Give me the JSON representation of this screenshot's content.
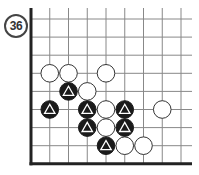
{
  "problem": {
    "number": "36"
  },
  "board": {
    "origin_x": 31,
    "origin_y": 19,
    "spacing_x": 18.75,
    "spacing_y": 18.1,
    "cols": 9,
    "rows": 9,
    "right_extent": 192,
    "bottom_edge_row": 8,
    "top_extends": true,
    "right_extends": true,
    "left_edge": true,
    "bottom_edge": true,
    "line_color": "#888888",
    "edge_color": "#222222",
    "black_color": "#1a1a1a",
    "white_color": "#ffffff",
    "marker": "triangle",
    "stones": [
      {
        "color": "white",
        "col": 1,
        "row": 3,
        "marked": false
      },
      {
        "color": "white",
        "col": 2,
        "row": 3,
        "marked": false
      },
      {
        "color": "white",
        "col": 4,
        "row": 3,
        "marked": false
      },
      {
        "color": "black",
        "col": 2,
        "row": 4,
        "marked": true
      },
      {
        "color": "white",
        "col": 3,
        "row": 4,
        "marked": false
      },
      {
        "color": "black",
        "col": 1,
        "row": 5,
        "marked": true
      },
      {
        "color": "black",
        "col": 3,
        "row": 5,
        "marked": true
      },
      {
        "color": "white",
        "col": 4,
        "row": 5,
        "marked": false
      },
      {
        "color": "black",
        "col": 5,
        "row": 5,
        "marked": true
      },
      {
        "color": "white",
        "col": 7,
        "row": 5,
        "marked": false
      },
      {
        "color": "black",
        "col": 3,
        "row": 6,
        "marked": true
      },
      {
        "color": "white",
        "col": 4,
        "row": 6,
        "marked": false
      },
      {
        "color": "black",
        "col": 5,
        "row": 6,
        "marked": true
      },
      {
        "color": "black",
        "col": 4,
        "row": 7,
        "marked": true
      },
      {
        "color": "white",
        "col": 5,
        "row": 7,
        "marked": false
      },
      {
        "color": "white",
        "col": 6,
        "row": 7,
        "marked": false
      }
    ]
  }
}
